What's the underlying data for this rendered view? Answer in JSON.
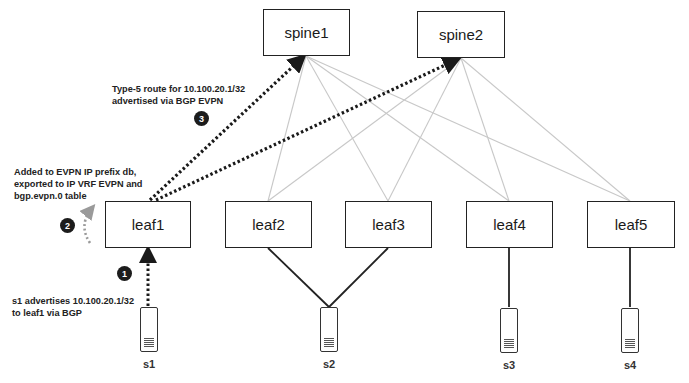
{
  "diagram": {
    "spines": [
      {
        "id": "spine1",
        "label": "spine1"
      },
      {
        "id": "spine2",
        "label": "spine2"
      }
    ],
    "leaves": [
      {
        "id": "leaf1",
        "label": "leaf1"
      },
      {
        "id": "leaf2",
        "label": "leaf2"
      },
      {
        "id": "leaf3",
        "label": "leaf3"
      },
      {
        "id": "leaf4",
        "label": "leaf4"
      },
      {
        "id": "leaf5",
        "label": "leaf5"
      }
    ],
    "servers": [
      {
        "id": "s1",
        "label": "s1",
        "connects_to": [
          "leaf1"
        ]
      },
      {
        "id": "s2",
        "label": "s2",
        "connects_to": [
          "leaf2",
          "leaf3"
        ]
      },
      {
        "id": "s3",
        "label": "s3",
        "connects_to": [
          "leaf4"
        ]
      },
      {
        "id": "s4",
        "label": "s4",
        "connects_to": [
          "leaf5"
        ]
      }
    ],
    "fabric_links": "every spine connects to every leaf (light gray)",
    "steps": [
      {
        "number": "1",
        "text_line1": "s1 advertises 10.100.20.1/32",
        "text_line2": "to leaf1 via BGP"
      },
      {
        "number": "2",
        "text_line1": "Added to EVPN IP prefix db,",
        "text_line2": "exported to IP VRF EVPN and",
        "text_line3": "bgp.evpn.0 table"
      },
      {
        "number": "3",
        "text_line1": "Type-5 route for 10.100.20.1/32",
        "text_line2": "advertised via BGP EVPN"
      }
    ],
    "colors": {
      "node_border": "#222222",
      "fabric_link": "#c8c8c8",
      "server_link": "#222222",
      "route_arrow": "#1a1a1a",
      "local_arrow": "#9a9a9a",
      "badge": "#1c1c1c"
    }
  }
}
